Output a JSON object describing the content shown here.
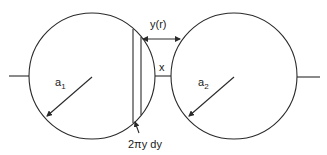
{
  "diagram": {
    "type": "two-sphere interaction geometry",
    "labels": {
      "radius_left": "a",
      "radius_left_sub": "1",
      "radius_right": "a",
      "radius_right_sub": "2",
      "gap": "x",
      "distance": "y(r)",
      "ring_area": "2πy dy"
    },
    "colors": {
      "line": "#2a2a2a",
      "text": "#1a1a1a",
      "background": "#ffffff"
    }
  }
}
